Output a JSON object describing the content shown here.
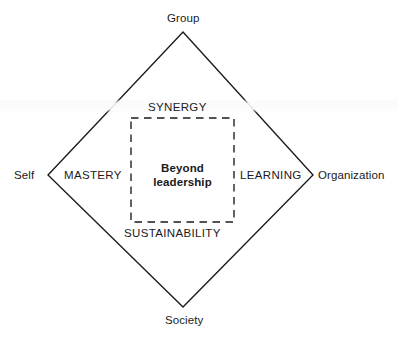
{
  "diagram": {
    "colors": {
      "stroke": "#1a1a1a",
      "text": "#1a1a1a",
      "background": "#ffffff"
    },
    "center": {
      "line1": "Beyond",
      "line2": "leadership"
    },
    "vertices": [
      {
        "id": "top",
        "label": "Group"
      },
      {
        "id": "right",
        "label": "Organization"
      },
      {
        "id": "bottom",
        "label": "Society"
      },
      {
        "id": "left",
        "label": "Self"
      }
    ],
    "quadrants": [
      {
        "id": "synergy",
        "label": "SYNERGY"
      },
      {
        "id": "learning",
        "label": "LEARNING"
      },
      {
        "id": "sustainability",
        "label": "SUSTAINABILITY"
      },
      {
        "id": "mastery",
        "label": "MASTERY"
      }
    ],
    "shapes": {
      "diamond": {
        "type": "solid-outline",
        "points": "183,32 313,175 183,307 48,175"
      },
      "inner_square": {
        "type": "dashed-outline",
        "x": 131,
        "y": 118,
        "width": 103,
        "height": 104
      }
    }
  }
}
